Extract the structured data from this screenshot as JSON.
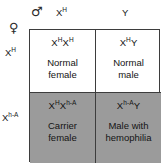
{
  "diagram": {
    "type": "punnett-square",
    "shaded_color": "#9b9b9b",
    "border_color": "#3d3d3d",
    "background_color": "#ffffff"
  },
  "parents": {
    "male": {
      "symbol": "♂",
      "symbol_name": "male-symbol",
      "gametes": [
        "X^H",
        "Y"
      ]
    },
    "female": {
      "symbol": "♀",
      "symbol_name": "female-symbol",
      "gametes": [
        "X^H",
        "X^h-A"
      ]
    }
  },
  "columns": [
    {
      "allele": "X",
      "superscript": "H"
    },
    {
      "allele": "Y",
      "superscript": ""
    }
  ],
  "rows": [
    {
      "allele": "X",
      "superscript": "H"
    },
    {
      "allele": "X",
      "superscript": "h-A"
    }
  ],
  "cells": [
    {
      "position": "top-left",
      "genotype": [
        {
          "allele": "X",
          "superscript": "H"
        },
        {
          "allele": "X",
          "superscript": "H"
        }
      ],
      "phenotype_lines": [
        "Normal",
        "female"
      ],
      "shaded": false
    },
    {
      "position": "top-right",
      "genotype": [
        {
          "allele": "X",
          "superscript": "H"
        },
        {
          "allele": "Y",
          "superscript": ""
        }
      ],
      "phenotype_lines": [
        "Normal",
        "male"
      ],
      "shaded": false
    },
    {
      "position": "bottom-left",
      "genotype": [
        {
          "allele": "X",
          "superscript": "H"
        },
        {
          "allele": "X",
          "superscript": "h-A"
        }
      ],
      "phenotype_lines": [
        "Carrier",
        "female"
      ],
      "shaded": true
    },
    {
      "position": "bottom-right",
      "genotype": [
        {
          "allele": "X",
          "superscript": "h-A"
        },
        {
          "allele": "Y",
          "superscript": ""
        }
      ],
      "phenotype_lines": [
        "Male with",
        "hemophilia"
      ],
      "shaded": true
    }
  ]
}
